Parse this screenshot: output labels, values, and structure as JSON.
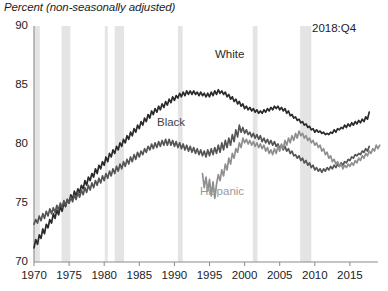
{
  "chart_data": {
    "type": "line",
    "title": "Percent (non-seasonally adjusted)",
    "xlabel": "",
    "ylabel": "Percent (non-seasonally adjusted)",
    "xlim": [
      1970,
      2019
    ],
    "ylim": [
      70,
      90
    ],
    "yticks": [
      70,
      75,
      80,
      85,
      90
    ],
    "xticks": [
      1970,
      1975,
      1980,
      1985,
      1990,
      1995,
      2000,
      2005,
      2010,
      2015
    ],
    "grid": false,
    "legend_position": "inline-annotations",
    "annotations": [
      {
        "text": "2018:Q4",
        "x": 2016.5,
        "y": 89.0
      }
    ],
    "recession_bands": [
      {
        "start": 1969.92,
        "end": 1970.83
      },
      {
        "start": 1973.92,
        "end": 1975.17
      },
      {
        "start": 1980.08,
        "end": 1980.5
      },
      {
        "start": 1981.5,
        "end": 1982.83
      },
      {
        "start": 1990.5,
        "end": 1991.17
      },
      {
        "start": 2001.17,
        "end": 2001.83
      },
      {
        "start": 2007.92,
        "end": 2009.5
      }
    ],
    "recession_color": "#e4e4e4",
    "series": [
      {
        "name": "White",
        "color": "#2a2a2a",
        "label_text": "White",
        "x_start": 1970.0,
        "x_step": 0.25,
        "values": [
          71.2,
          71.9,
          71.5,
          72.3,
          72.0,
          72.8,
          72.4,
          73.2,
          72.9,
          73.6,
          73.3,
          74.1,
          73.7,
          74.4,
          74.0,
          74.7,
          74.3,
          75.0,
          74.7,
          75.3,
          75.0,
          75.7,
          75.3,
          76.0,
          75.6,
          76.2,
          75.9,
          76.5,
          76.2,
          76.9,
          76.5,
          77.2,
          76.9,
          77.5,
          77.2,
          77.9,
          77.5,
          78.2,
          77.9,
          78.5,
          78.2,
          78.9,
          78.5,
          79.2,
          78.9,
          79.5,
          79.2,
          79.8,
          79.5,
          80.1,
          79.8,
          80.4,
          80.1,
          80.7,
          80.4,
          81.0,
          80.7,
          81.3,
          81.0,
          81.6,
          81.3,
          81.9,
          81.6,
          82.2,
          81.9,
          82.5,
          82.2,
          82.8,
          82.5,
          83.0,
          82.7,
          83.2,
          82.9,
          83.4,
          83.1,
          83.6,
          83.3,
          83.8,
          83.5,
          84.0,
          83.7,
          84.1,
          83.9,
          84.3,
          84.0,
          84.4,
          84.1,
          84.5,
          84.2,
          84.5,
          84.2,
          84.5,
          84.2,
          84.4,
          84.1,
          84.4,
          84.1,
          84.3,
          84.0,
          84.3,
          84.0,
          84.4,
          84.1,
          84.5,
          84.2,
          84.6,
          84.3,
          84.5,
          84.2,
          84.4,
          84.0,
          84.2,
          83.8,
          84.0,
          83.6,
          83.8,
          83.4,
          83.6,
          83.2,
          83.4,
          83.0,
          83.2,
          82.9,
          83.1,
          82.8,
          83.0,
          82.7,
          82.9,
          82.6,
          82.8,
          82.6,
          82.9,
          82.7,
          83.0,
          82.8,
          83.1,
          82.9,
          83.2,
          83.0,
          83.2,
          82.9,
          83.1,
          82.8,
          83.0,
          82.6,
          82.8,
          82.4,
          82.5,
          82.2,
          82.3,
          82.0,
          82.1,
          81.8,
          81.9,
          81.6,
          81.7,
          81.4,
          81.5,
          81.2,
          81.3,
          81.0,
          81.2,
          81.0,
          81.1,
          80.9,
          81.0,
          80.8,
          80.9,
          80.8,
          81.0,
          80.9,
          81.2,
          81.0,
          81.3,
          81.2,
          81.4,
          81.3,
          81.6,
          81.4,
          81.7,
          81.5,
          81.8,
          81.6,
          81.9,
          81.7,
          82.0,
          81.8,
          82.1,
          81.9,
          82.3,
          82.1,
          82.7
        ]
      },
      {
        "name": "Black",
        "color": "#555555",
        "label_text": "Black",
        "x_start": 1970.0,
        "x_step": 0.25,
        "values": [
          73.2,
          73.6,
          73.3,
          73.9,
          73.5,
          74.1,
          73.7,
          74.3,
          73.9,
          74.5,
          74.1,
          74.6,
          74.2,
          74.8,
          74.4,
          75.0,
          74.6,
          75.2,
          74.8,
          75.3,
          75.0,
          75.5,
          75.1,
          75.7,
          75.3,
          75.9,
          75.5,
          76.1,
          75.7,
          76.3,
          75.9,
          76.5,
          76.1,
          76.7,
          76.3,
          76.9,
          76.5,
          77.1,
          76.7,
          77.3,
          76.9,
          77.5,
          77.1,
          77.7,
          77.3,
          77.9,
          77.5,
          78.1,
          77.7,
          78.3,
          77.9,
          78.5,
          78.1,
          78.7,
          78.3,
          78.9,
          78.5,
          79.1,
          78.7,
          79.3,
          78.9,
          79.4,
          79.1,
          79.6,
          79.3,
          79.8,
          79.5,
          80.0,
          79.6,
          80.1,
          79.7,
          80.2,
          79.8,
          80.3,
          79.9,
          80.4,
          79.9,
          80.4,
          79.9,
          80.3,
          79.8,
          80.2,
          79.7,
          80.1,
          79.6,
          80.0,
          79.5,
          79.9,
          79.4,
          79.8,
          79.3,
          79.7,
          79.2,
          79.6,
          79.1,
          79.5,
          79.0,
          79.4,
          78.9,
          79.5,
          79.0,
          79.6,
          79.1,
          79.7,
          79.2,
          79.9,
          79.3,
          80.1,
          79.5,
          80.3,
          79.7,
          80.5,
          79.9,
          80.8,
          80.2,
          81.2,
          80.6,
          81.6,
          81.0,
          81.4,
          80.9,
          81.2,
          80.8,
          81.0,
          80.6,
          80.9,
          80.5,
          80.8,
          80.4,
          80.7,
          80.2,
          80.5,
          80.1,
          80.4,
          80.0,
          80.3,
          79.9,
          80.2,
          79.8,
          80.0,
          79.6,
          79.9,
          79.5,
          79.8,
          79.4,
          79.6,
          79.2,
          79.4,
          79.0,
          79.1,
          78.8,
          79.0,
          78.6,
          78.8,
          78.4,
          78.6,
          78.2,
          78.4,
          78.0,
          78.2,
          77.8,
          78.0,
          77.7,
          77.9,
          77.6,
          77.9,
          77.7,
          78.0,
          77.8,
          78.1,
          77.9,
          78.2,
          78.0,
          78.3,
          78.1,
          78.4,
          78.2,
          78.5,
          78.4,
          78.7,
          78.6,
          78.9,
          78.8,
          79.1,
          79.0,
          79.2,
          79.1,
          79.4,
          79.3,
          79.6,
          79.4,
          79.8
        ]
      },
      {
        "name": "Hispanic",
        "color": "#8f8f8f",
        "label_text": "Hispanic",
        "x_start": 1994.0,
        "x_step": 0.25,
        "values": [
          77.5,
          76.3,
          77.2,
          76.0,
          77.0,
          75.6,
          76.8,
          75.4,
          76.6,
          77.4,
          76.9,
          77.8,
          77.3,
          78.3,
          77.8,
          78.8,
          78.3,
          79.2,
          78.8,
          79.6,
          79.3,
          80.1,
          79.7,
          80.5,
          80.1,
          80.4,
          80.0,
          80.3,
          79.9,
          80.2,
          79.8,
          80.1,
          79.7,
          80.0,
          79.6,
          79.9,
          79.4,
          79.7,
          79.2,
          79.5,
          79.1,
          79.6,
          79.2,
          79.8,
          79.4,
          80.0,
          79.6,
          80.3,
          79.9,
          80.5,
          80.1,
          80.7,
          80.3,
          80.9,
          80.5,
          81.1,
          80.7,
          80.9,
          80.5,
          80.7,
          80.3,
          80.5,
          80.1,
          80.3,
          79.9,
          80.1,
          79.7,
          79.9,
          79.4,
          79.6,
          79.1,
          79.3,
          78.8,
          79.0,
          78.5,
          78.7,
          78.3,
          78.5,
          78.1,
          78.3,
          77.9,
          78.2,
          78.0,
          78.3,
          78.1,
          78.4,
          78.2,
          78.6,
          78.4,
          78.8,
          78.6,
          79.0,
          78.8,
          79.2,
          79.0,
          79.4,
          79.2,
          79.6,
          79.4,
          79.9,
          79.6,
          79.9
        ]
      }
    ]
  },
  "axis": {
    "y_labels": [
      "90",
      "85",
      "80",
      "75",
      "70"
    ],
    "x_labels": [
      "1970",
      "1975",
      "1980",
      "1985",
      "1990",
      "1995",
      "2000",
      "2005",
      "2010",
      "2015"
    ]
  },
  "labels": {
    "title": "Percent (non-seasonally adjusted)",
    "white": "White",
    "black": "Black",
    "hispanic": "Hispanic",
    "quarter": "2018:Q4"
  }
}
